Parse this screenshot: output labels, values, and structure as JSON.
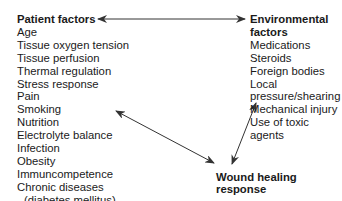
{
  "diagram": {
    "patient_factors": {
      "title": "Patient factors",
      "items": [
        "Age",
        "Tissue oxygen tension",
        "Tissue perfusion",
        "Thermal regulation",
        "Stress response",
        "Pain",
        "Smoking",
        "Nutrition",
        "Electrolyte balance",
        "Infection",
        "Obesity",
        "Immuncompetence",
        "Chronic diseases",
        "(diabetes mellitus)"
      ]
    },
    "environmental_factors": {
      "title": "Environmental factors",
      "items": [
        "Medications",
        "Steroids",
        "Foreign bodies",
        "Local pressure/shearing",
        "Mechanical injury",
        "Use of toxic agents"
      ]
    },
    "outcome": {
      "title": "Wound healing response"
    },
    "arrows": [
      {
        "from": "Patient factors",
        "to": "Environmental factors",
        "type": "bidirectional"
      },
      {
        "from": "Patient factors",
        "to": "Wound healing response",
        "type": "bidirectional"
      },
      {
        "from": "Environmental factors",
        "to": "Wound healing response",
        "type": "bidirectional"
      }
    ],
    "line_color": "#333333"
  }
}
